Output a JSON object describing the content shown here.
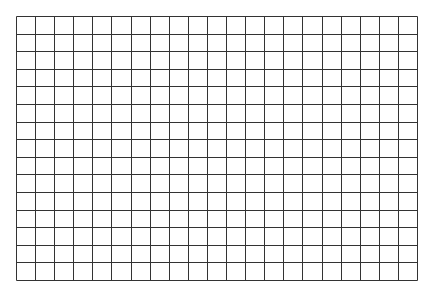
{
  "grid": {
    "columns": 21,
    "rows": 15,
    "left": 16,
    "top": 16,
    "width": 401,
    "height": 264,
    "line_color": "#333333",
    "background": "#ffffff"
  }
}
